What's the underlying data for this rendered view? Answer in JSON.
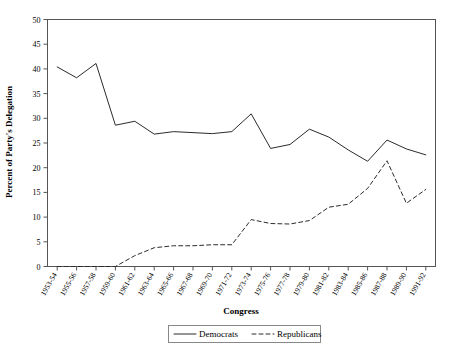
{
  "chart_data": {
    "type": "line",
    "title": "",
    "xlabel": "Congress",
    "ylabel": "Percent of Party's Delegation",
    "ylim": [
      0,
      50
    ],
    "ytick_step": 5,
    "yticks": [
      0,
      5,
      10,
      15,
      20,
      25,
      30,
      35,
      40,
      45,
      50
    ],
    "grid": false,
    "legend_position": "bottom-center",
    "categories": [
      "1953-54",
      "1955-56",
      "1957-58",
      "1959-60",
      "1961-62",
      "1963-64",
      "1965-66",
      "1967-68",
      "1969-70",
      "1971-72",
      "1973-74",
      "1975-76",
      "1977-78",
      "1979-80",
      "1981-82",
      "1983-84",
      "1985-86",
      "1987-88",
      "1989-90",
      "1991-92"
    ],
    "series": [
      {
        "name": "Democrats",
        "style": "solid",
        "color": "#2b2b2b",
        "values": [
          40.4,
          38.2,
          41.1,
          28.6,
          29.4,
          26.8,
          27.3,
          27.1,
          26.9,
          27.3,
          30.9,
          23.9,
          24.7,
          27.8,
          26.2,
          23.6,
          21.3,
          25.6,
          23.8,
          22.6
        ]
      },
      {
        "name": "Republicans",
        "style": "dashed",
        "color": "#2b2b2b",
        "values": [
          0.0,
          0.0,
          0.0,
          0.0,
          2.2,
          3.8,
          4.2,
          4.2,
          4.4,
          4.4,
          9.5,
          8.7,
          8.6,
          9.3,
          12.0,
          12.6,
          15.8,
          21.4,
          12.8,
          15.6
        ]
      }
    ]
  },
  "legend": {
    "items": [
      {
        "label": "Democrats",
        "style": "solid"
      },
      {
        "label": "Republicans",
        "style": "dashed"
      }
    ]
  }
}
